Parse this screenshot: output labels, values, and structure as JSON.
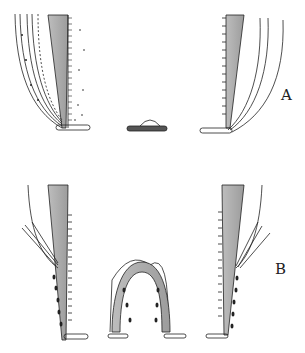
{
  "figure": {
    "panels": [
      {
        "label": "A",
        "description": "Cross-section with bent leaflets and central small dome"
      },
      {
        "label": "B",
        "description": "Cross-section with short leaflets and central arch"
      }
    ],
    "colors": {
      "ink": "#222222",
      "fill": "#a8a8a8",
      "background": "#ffffff"
    }
  }
}
